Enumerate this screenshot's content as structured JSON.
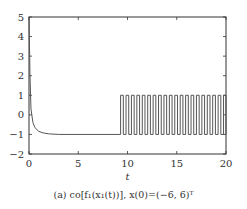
{
  "chart_data": {
    "type": "line",
    "title": "",
    "xlabel": "t",
    "ylabel": "",
    "xlim": [
      0,
      20
    ],
    "ylim": [
      -2,
      5
    ],
    "xticks": [
      0,
      5,
      10,
      15,
      20
    ],
    "yticks": [
      -2,
      -1,
      0,
      1,
      2,
      3,
      4,
      5
    ],
    "grid": false,
    "series": [
      {
        "name": "co[f1(x1(t))]",
        "description": "Starts near 5 at t=0, decays rapidly to about -1 by t≈2, stays at -1 until t≈9.3, then switches periodically between -1 and 1 (about 20 pulses) until t=20",
        "decay": {
          "x": [
            0,
            0.1,
            0.2,
            0.4,
            0.6,
            1.0,
            1.5,
            2.0,
            3.0,
            9.3
          ],
          "y": [
            5,
            2.0,
            0.3,
            -0.4,
            -0.65,
            -0.85,
            -0.93,
            -0.97,
            -1.0,
            -1.0
          ]
        },
        "switching": {
          "start": 9.3,
          "end": 20,
          "period": 0.55,
          "duty": 0.5,
          "low": -1,
          "high": 1
        }
      }
    ],
    "line_color": "#555555"
  },
  "caption": {
    "text": "(a) co[f₁(x₁(t))], x(0)=(−6, 6)ᵀ"
  }
}
